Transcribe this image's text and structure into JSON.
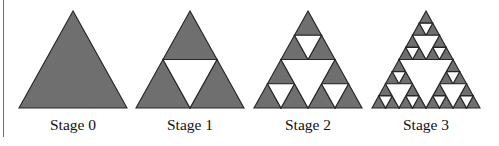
{
  "figure": {
    "colors": {
      "fill": "#6f6f6f",
      "stroke": "#262626",
      "hole": "#ffffff",
      "rule": "#6e6e6e"
    },
    "stages": [
      {
        "label": "Stage 0",
        "depth": 0,
        "apex": [
          73,
          11
        ],
        "left": [
          19,
          108
        ],
        "right": [
          127,
          108
        ]
      },
      {
        "label": "Stage 1",
        "depth": 1,
        "apex": [
          190,
          11
        ],
        "left": [
          136,
          108
        ],
        "right": [
          244,
          108
        ]
      },
      {
        "label": "Stage 2",
        "depth": 2,
        "apex": [
          308,
          11
        ],
        "left": [
          254,
          108
        ],
        "right": [
          362,
          108
        ]
      },
      {
        "label": "Stage 3",
        "depth": 3,
        "apex": [
          426,
          11
        ],
        "left": [
          372,
          108
        ],
        "right": [
          480,
          108
        ]
      }
    ]
  }
}
